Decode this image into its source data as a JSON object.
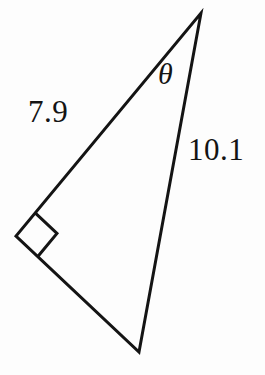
{
  "figure": {
    "type": "geometry-diagram",
    "shape": "right-triangle",
    "background_color": "#fdfdfd",
    "stroke_color": "#141414",
    "stroke_width": 3,
    "vertices": {
      "apex": {
        "x": 201,
        "y": 13
      },
      "bottom": {
        "x": 139,
        "y": 352
      },
      "right_angle": {
        "x": 16,
        "y": 236
      }
    },
    "right_angle_marker": {
      "present": true,
      "size": 30,
      "at_vertex": "right_angle"
    },
    "labels": {
      "side_a": "7.9",
      "side_b": "10.1",
      "angle": "θ"
    },
    "label_meanings": {
      "side_a_description": "length of the upper-left leg from the right-angle vertex to the apex",
      "side_b_description": "length of the right leg from the apex to the bottom vertex",
      "angle_description": "angle at the apex between the two labeled sides"
    }
  }
}
